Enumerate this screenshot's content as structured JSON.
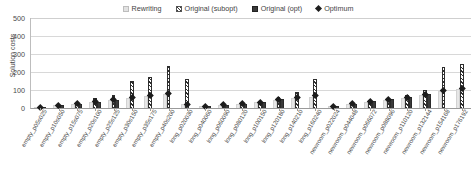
{
  "legend": {
    "items": [
      {
        "label": "Rewriting",
        "icon": "square-light-gray",
        "color": "#e6e6e6"
      },
      {
        "label": "Original (subopt)",
        "icon": "square-hatched",
        "color": "#2e2e2e"
      },
      {
        "label": "Original (opt)",
        "icon": "square-dark",
        "color": "#3a3a3a"
      },
      {
        "label": "Optimum",
        "icon": "diamond-marker",
        "color": "#1c1c1c"
      }
    ]
  },
  "axes": {
    "y_label": "Solution costs",
    "y_ticks": [
      "0",
      "100",
      "200",
      "300",
      "400",
      "500"
    ]
  },
  "chart_data": {
    "type": "bar",
    "title": "",
    "xlabel": "",
    "ylabel": "Solution costs",
    "ylim": [
      0,
      500
    ],
    "grid": true,
    "legend_position": "top-center",
    "categories": [
      "empty_p05s025",
      "empty_p10s050",
      "empty_p15s075",
      "empty_p20s100",
      "empty_p25s125",
      "empty_p30s150",
      "empty_p35s175",
      "empty_p40s200",
      "long_p020030",
      "long_p040060",
      "long_p060090",
      "long_p080120",
      "long_p100150",
      "long_p120180",
      "long_p140210",
      "long_p160240",
      "newroom_p022024",
      "newroom_p044048",
      "newroom_p066072",
      "newroom_p088096",
      "newroom_p110120",
      "newroom_p132144",
      "newroom_p154168",
      "newroom_p176192"
    ],
    "series": [
      {
        "name": "Rewriting",
        "values": [
          6,
          14,
          22,
          34,
          44,
          56,
          66,
          80,
          20,
          10,
          16,
          22,
          32,
          44,
          54,
          62,
          12,
          22,
          36,
          46,
          58,
          72,
          96,
          104
        ]
      },
      {
        "name": "Original (subopt)",
        "values": [
          8,
          18,
          30,
          54,
          74,
          150,
          172,
          232,
          160,
          12,
          20,
          28,
          40,
          60,
          90,
          160,
          14,
          26,
          44,
          58,
          74,
          100,
          230,
          244
        ]
      },
      {
        "name": "Original (opt)",
        "values": [
          6,
          14,
          24,
          36,
          46,
          0,
          0,
          0,
          0,
          10,
          18,
          24,
          34,
          48,
          0,
          0,
          12,
          24,
          38,
          48,
          62,
          78,
          0,
          0
        ]
      }
    ],
    "optimum_marker": {
      "name": "Optimum",
      "values": [
        6,
        14,
        24,
        36,
        46,
        58,
        70,
        84,
        22,
        10,
        18,
        24,
        34,
        48,
        58,
        68,
        12,
        24,
        38,
        48,
        62,
        78,
        100,
        110
      ]
    },
    "spike_values": [
      {
        "category": "long_p120180",
        "series": "Original (subopt)",
        "value": 160
      },
      {
        "category": "long_p140210",
        "series": "Original (subopt)",
        "value": 310
      },
      {
        "category": "long_p160240",
        "series": "Original (subopt)",
        "value": 500
      }
    ]
  }
}
